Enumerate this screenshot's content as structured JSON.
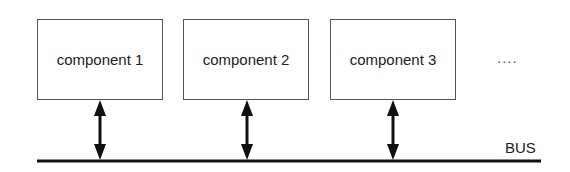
{
  "diagram": {
    "components": [
      {
        "label": "component 1",
        "x": 37,
        "y": 19,
        "w": 126,
        "h": 81,
        "arrow_x": 100
      },
      {
        "label": "component 2",
        "x": 183,
        "y": 19,
        "w": 126,
        "h": 81,
        "arrow_x": 247
      },
      {
        "label": "component 3",
        "x": 330,
        "y": 19,
        "w": 126,
        "h": 81,
        "arrow_x": 393
      }
    ],
    "ellipsis": "....",
    "bus": {
      "label": "BUS",
      "x1": 37,
      "x2": 541,
      "y": 161
    },
    "line_color": "#111111"
  }
}
